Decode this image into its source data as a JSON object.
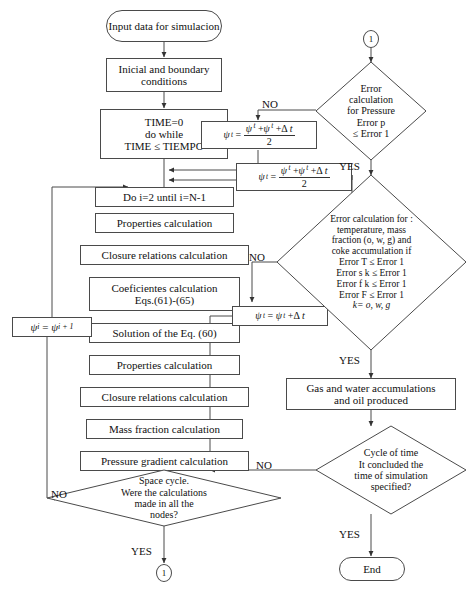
{
  "diagram": {
    "type": "flowchart",
    "stroke_color": "#4a4a4a",
    "text_color": "#111111",
    "background": "#ffffff"
  },
  "nodes": {
    "start": {
      "label": "Input data for simulacion",
      "shape": "terminator"
    },
    "initial_conditions": {
      "label": "Inicial and boundary conditions",
      "shape": "process"
    },
    "time_init": {
      "line1": "TIME=0",
      "line2": "do while",
      "line3": "TIME ≤ TIEMPO",
      "shape": "process"
    },
    "space_loop": {
      "label": "Do i=2 until i=N-1",
      "shape": "process"
    },
    "properties_1": {
      "label": "Properties calculation",
      "shape": "process"
    },
    "closure_1": {
      "label": "Closure relations calculation",
      "shape": "process"
    },
    "coefficients": {
      "line1": "Coeficientes calculation",
      "line2": "Eqs.(61)-(65)",
      "shape": "process"
    },
    "solution_eq": {
      "label": "Solution of the Eq. (60)",
      "shape": "process"
    },
    "properties_2": {
      "label": "Properties calculation",
      "shape": "process"
    },
    "closure_2": {
      "label": "Closure relations calculation",
      "shape": "process"
    },
    "mass_fraction": {
      "label": "Mass fraction calculation",
      "shape": "process"
    },
    "pressure_gradient": {
      "label": "Pressure gradient calculation",
      "shape": "process"
    },
    "psi_shift": {
      "formula": "ψ i = ψ i+1",
      "shape": "process"
    },
    "psi_avg_1": {
      "formula": "ψ t = (ψ t + ψ t+Δt) / 2",
      "shape": "process"
    },
    "psi_avg_2": {
      "formula": "ψ t = (ψ t + ψ t+Δt) / 2",
      "shape": "process"
    },
    "psi_advance": {
      "formula": "ψ t = ψ t+Δt",
      "shape": "process"
    },
    "accumulations": {
      "line1": "Gas and water accumulations",
      "line2": "and oil produced",
      "shape": "process"
    },
    "end": {
      "label": "End",
      "shape": "terminator"
    }
  },
  "decisions": {
    "space_cycle": {
      "lines": [
        "Space cycle.",
        "Were the calculations",
        "made in all the",
        "nodes?"
      ],
      "yes_label": "YES",
      "no_label": "NO"
    },
    "pressure_error": {
      "lines": [
        "Error",
        "calculation",
        "for Pressure",
        "Error p",
        "≤ Error 1"
      ],
      "yes_label": "YES",
      "no_label": "NO"
    },
    "multi_error": {
      "lines": [
        "Error calculation for :",
        "temperature, mass",
        "fraction (o, w, g) and",
        "coke accumulation if",
        "Error T  ≤ Error 1",
        "Error s k  ≤ Error 1",
        "Error  f k  ≤ Error 1",
        "Error F  ≤ Error 1",
        "k= o, w, g"
      ],
      "yes_label": "YES",
      "no_label": "NO"
    },
    "time_cycle": {
      "lines": [
        "Cycle of time",
        "It concluded the",
        "time of simulation",
        "specified?"
      ],
      "yes_label": "YES",
      "no_label": "NO"
    }
  },
  "connectors": {
    "top_right": {
      "label": "1"
    },
    "bottom_center": {
      "label": "1"
    }
  },
  "edge_labels": {
    "no_pressure": "NO",
    "no_multi_error": "NO",
    "no_space_cycle": "NO",
    "no_time_cycle": "NO",
    "yes_pressure": "YES",
    "yes_multi_error": "YES",
    "yes_space_cycle": "YES",
    "yes_time_cycle": "YES"
  }
}
